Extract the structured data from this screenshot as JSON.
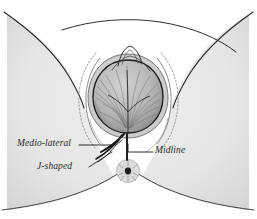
{
  "figure": {
    "background_color": "#ffffff",
    "body_fill_color": "#e9e9e9",
    "body_fill_shadow": "#dcdcdc",
    "ink_color": "#1f1f1f",
    "soft_ink_color": "#6f6f6f",
    "head_fill_color": "#b9b9b9"
  },
  "annotations": [
    {
      "id": "medio-lateral",
      "label": "Medio-lateral",
      "leader_from_x": 78,
      "leader_from_y": 145,
      "leader_to_x": 118,
      "leader_to_y": 145
    },
    {
      "id": "midline",
      "label": "Midline",
      "leader_from_x": 152,
      "leader_from_y": 152,
      "leader_to_x": 128,
      "leader_to_y": 152
    },
    {
      "id": "j-shaped",
      "label": "J-shaped",
      "leader_from_x": 88,
      "leader_from_y": 167,
      "leader_to_x": 116,
      "leader_to_y": 150
    }
  ],
  "incisions": [
    {
      "id": "medio-lateral-incision",
      "name": "medio-lateral incision line"
    },
    {
      "id": "midline-incision",
      "name": "midline incision line"
    },
    {
      "id": "j-shaped-incision",
      "name": "j-shaped incision line"
    }
  ],
  "anatomy": [
    {
      "id": "fetal-head",
      "name": "crowning fetal head"
    },
    {
      "id": "vulval-ring",
      "name": "vulval ring"
    },
    {
      "id": "clitoral-hood",
      "name": "clitoral hood"
    },
    {
      "id": "labial-fold-left",
      "name": "left labial fold"
    },
    {
      "id": "labial-fold-right",
      "name": "right labial fold"
    },
    {
      "id": "anus",
      "name": "anus"
    },
    {
      "id": "thigh-left",
      "name": "left thigh"
    },
    {
      "id": "thigh-right",
      "name": "right thigh"
    },
    {
      "id": "perineum",
      "name": "perineum"
    }
  ]
}
